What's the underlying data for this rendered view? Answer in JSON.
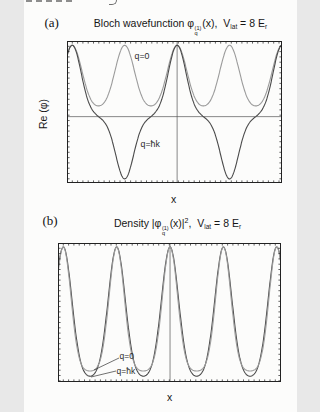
{
  "figure": {
    "background": "#fcfcfb",
    "colors": {
      "frame": "#222222",
      "ref_line": "#555555",
      "dark_curve": "#4a4a4a",
      "light_curve": "#9b9b9b",
      "annotation_line": "#333333"
    },
    "panel_a": {
      "tag": "(a)",
      "title": {
        "t1": "Bloch wavefunction ",
        "phi": "φ",
        "phi_sup": "(1)",
        "phi_sub": "q",
        "t2": "(x),",
        "v": "V",
        "v_sub": "lat",
        "t3": " = 8 ",
        "e": "E",
        "e_sub": "r"
      },
      "ylabel": "Re (φ)",
      "xlabel": "x",
      "curve_labels": {
        "q0": "q=0",
        "qk": "q=ħk"
      }
    },
    "panel_b": {
      "tag": "(b)",
      "title": {
        "t1": "Density |",
        "phi": "φ",
        "phi_sup": "(1)",
        "phi_sub": "q",
        "t2": "(x)|",
        "t2_sup": "2",
        "t2b": ",",
        "v": "V",
        "v_sub": "lat",
        "t3": " = 8 ",
        "e": "E",
        "e_sub": "r"
      },
      "xlabel": "x",
      "curve_labels": {
        "q0": "q=0",
        "qk": "q=ħk"
      }
    }
  },
  "chart_data": [
    {
      "panel": "a",
      "type": "line",
      "title": "Bloch wavefunction φ_q^(1)(x), V_lat = 8 E_r",
      "xlabel": "x",
      "ylabel": "Re (φ)",
      "x_unit": "lattice sites (one site = λ/2); axes have unlabeled minor ticks only",
      "x_range": [
        -2.1,
        2.0
      ],
      "y_range": [
        -0.93,
        1.06
      ],
      "grid": false,
      "legend": "inline text labels on curves",
      "reference_lines": {
        "horizontal": 0.0,
        "vertical": 0.0
      },
      "series": [
        {
          "name": "q=0",
          "color_key": "light_curve",
          "model": {
            "kind": "cos_harmonics",
            "mean": 0.515,
            "terms": [
              {
                "freq_per_site": 1,
                "amp": 0.425
              },
              {
                "freq_per_site": 2,
                "amp": 0.06
              }
            ]
          },
          "peaks": {
            "x": [
              -2,
              -1,
              0,
              1,
              2
            ],
            "y": 1.0
          },
          "minima": {
            "x": [
              -1.5,
              -0.5,
              0.5,
              1.5
            ],
            "y": 0.15
          },
          "sign": "always positive"
        },
        {
          "name": "q=ħk",
          "color_key": "dark_curve",
          "model": {
            "kind": "band_edge",
            "norm": 1.335,
            "neg_scale": 0.873,
            "terms": [
              {
                "freq_half": 1,
                "amp": 1.0
              },
              {
                "freq_half": 3,
                "amp": 0.3
              },
              {
                "freq_half": 5,
                "amp": 0.035
              }
            ]
          },
          "peaks": {
            "x": [
              -2,
              0,
              2
            ],
            "y": 1.0
          },
          "minima": {
            "x": [
              -1,
              1
            ],
            "y": -0.873
          },
          "zero_crossings_x": [
            -1.5,
            -0.5,
            0.5,
            1.5
          ],
          "sign": "alternates each lattice site"
        }
      ]
    },
    {
      "panel": "b",
      "type": "line",
      "title": "Density |φ_q^(1)(x)|², V_lat = 8 E_r",
      "xlabel": "x",
      "ylabel": "",
      "x_unit": "lattice sites (one site = λ/2); axes have unlabeled minor ticks only",
      "x_range": [
        -2.1,
        2.08
      ],
      "y_range": [
        -0.03,
        1.03
      ],
      "grid": false,
      "legend": "inline text labels with leader lines",
      "reference_lines": {
        "vertical": 0.0
      },
      "series": [
        {
          "name": "q=ħk",
          "color_key": "dark_curve",
          "model": {
            "kind": "gauss_comb",
            "base": 0.0,
            "scale": 1.0,
            "width": 0.225
          },
          "peaks": {
            "x": [
              -2,
              -1,
              0,
              1,
              2
            ],
            "y": 1.0
          },
          "minima_y": 0.0
        },
        {
          "name": "q=0",
          "color_key": "light_curve",
          "model": {
            "kind": "gauss_comb",
            "base": 0.05,
            "scale": 0.95,
            "width": 0.2
          },
          "peaks": {
            "x": [
              -2,
              -1,
              0,
              1,
              2
            ],
            "y": 1.0
          },
          "minima_y": 0.05
        }
      ],
      "annotations": [
        {
          "text": "q=0",
          "points_to": "q=0 density minimum (stays above zero)"
        },
        {
          "text": "q=ħk",
          "points_to": "q=ħk density minimum (touches zero)"
        }
      ]
    }
  ]
}
